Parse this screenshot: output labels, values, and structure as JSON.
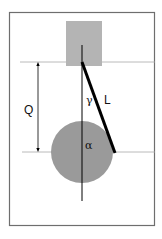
{
  "diagram": {
    "labels": {
      "stroke_length": "Q",
      "rod_length": "L",
      "rod_angle": "γ",
      "crank_angle": "α"
    },
    "colors": {
      "frame": "#6e6e6e",
      "guide_lines": "#a0a0a0",
      "piston_block": "#b4b4b4",
      "crank_disc": "#9a9a9a",
      "rod": "#000000",
      "axis": "#000000"
    }
  }
}
